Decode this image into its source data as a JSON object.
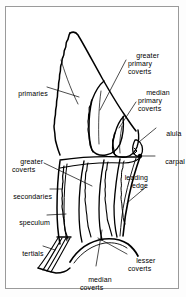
{
  "figure": {
    "style": "black line drawing on white, thin gray rectangular frame",
    "frame_color": "#9a9a9a",
    "ink_color": "#000000",
    "background_color": "#ffffff"
  },
  "labels": [
    {
      "id": "greater-primary-coverts",
      "text": "greater\nprimary\ncoverts",
      "align": "left",
      "x": 128,
      "y": 47,
      "lines": 3
    },
    {
      "id": "median-primary-coverts",
      "text": "median\nprimary\ncoverts",
      "align": "left",
      "x": 138,
      "y": 84,
      "lines": 3
    },
    {
      "id": "alula",
      "text": "alula",
      "align": "left",
      "x": 158,
      "y": 124,
      "lines": 1
    },
    {
      "id": "carpal",
      "text": "carpal",
      "align": "left",
      "x": 157,
      "y": 152,
      "lines": 1
    },
    {
      "id": "leading-edge",
      "text": "leading\nedge",
      "align": "right",
      "x": 148,
      "y": 169,
      "lines": 2
    },
    {
      "id": "primaries",
      "text": "primaries",
      "align": "left",
      "x": 10,
      "y": 84,
      "lines": 1
    },
    {
      "id": "greater-coverts",
      "text": "greater\ncoverts",
      "align": "left",
      "x": 12,
      "y": 152,
      "lines": 2
    },
    {
      "id": "secondaries",
      "text": "secondaries",
      "align": "left",
      "x": 5,
      "y": 186,
      "lines": 1
    },
    {
      "id": "speculum",
      "text": "speculum",
      "align": "left",
      "x": 11,
      "y": 212,
      "lines": 1
    },
    {
      "id": "tertials",
      "text": "tertials",
      "align": "left",
      "x": 14,
      "y": 242,
      "lines": 1
    },
    {
      "id": "median-coverts",
      "text": "median\ncoverts",
      "align": "left",
      "x": 80,
      "y": 270,
      "lines": 2
    },
    {
      "id": "lesser-coverts",
      "text": "lesser\ncoverts",
      "align": "left",
      "x": 128,
      "y": 253,
      "lines": 2
    }
  ],
  "leader_lines": [
    {
      "id": "leader-greater-primary-coverts",
      "from": [
        126,
        58
      ],
      "to": [
        100,
        110
      ]
    },
    {
      "id": "leader-median-primary-coverts",
      "from": [
        136,
        100
      ],
      "to": [
        118,
        127
      ]
    },
    {
      "id": "leader-alula",
      "from": [
        156,
        127
      ],
      "to": [
        138,
        141
      ]
    },
    {
      "id": "leader-carpal",
      "from": [
        155,
        155
      ],
      "to": [
        139,
        155
      ]
    },
    {
      "id": "leader-leading-edge",
      "from": [
        146,
        185
      ],
      "to": [
        125,
        205
      ]
    },
    {
      "id": "leader-primaries",
      "from": [
        46,
        88
      ],
      "to": [
        77,
        98
      ]
    },
    {
      "id": "leader-greater-coverts",
      "from": [
        42,
        163
      ],
      "to": [
        90,
        186
      ]
    },
    {
      "id": "leader-secondaries",
      "from": [
        50,
        189
      ],
      "to": [
        60,
        189
      ]
    },
    {
      "id": "leader-speculum",
      "from": [
        46,
        215
      ],
      "to": [
        64,
        214
      ]
    },
    {
      "id": "leader-tertials",
      "from": [
        42,
        246
      ],
      "to": [
        52,
        249
      ]
    },
    {
      "id": "leader-median-coverts",
      "from": [
        96,
        268
      ],
      "to": [
        102,
        230
      ]
    },
    {
      "id": "leader-lesser-coverts",
      "from": [
        126,
        256
      ],
      "to": [
        96,
        238
      ]
    }
  ],
  "anatomy_parts": [
    "primaries",
    "secondaries",
    "tertials",
    "speculum",
    "alula",
    "carpal",
    "leading edge",
    "greater coverts",
    "median coverts",
    "lesser coverts",
    "greater primary coverts",
    "median primary coverts"
  ]
}
